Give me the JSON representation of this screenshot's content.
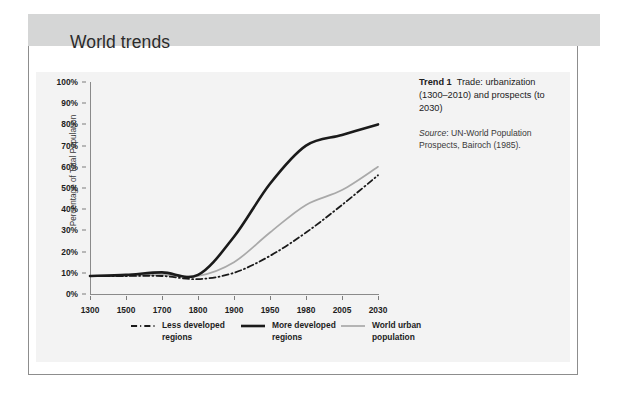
{
  "header": {
    "title": "World trends"
  },
  "caption": {
    "lead": "Trend 1",
    "body": "Trade: urbanization (1300–2010) and prospects (to 2030)",
    "source_label": "Source",
    "source_text": ": UN-World Population Prospects, Bairoch (1985)."
  },
  "chart_data": {
    "type": "line",
    "title": "",
    "xlabel": "",
    "ylabel": "Percentage of Total Population",
    "categories": [
      "1300",
      "1500",
      "1700",
      "1800",
      "1900",
      "1950",
      "1980",
      "2005",
      "2030"
    ],
    "ylim": [
      0,
      100
    ],
    "ytick_labels": [
      "0%",
      "10%",
      "20%",
      "30%",
      "40%",
      "50%",
      "60%",
      "70%",
      "80%",
      "90%",
      "100%"
    ],
    "ytick_values": [
      0,
      10,
      20,
      30,
      40,
      50,
      60,
      70,
      80,
      90,
      100
    ],
    "grid": false,
    "legend_position": "bottom",
    "series": [
      {
        "name": "Less developed regions",
        "style": "dash-dot",
        "color": "#1a1a1a",
        "width": 1.8,
        "values": [
          8.5,
          8.5,
          8.5,
          7.0,
          10.0,
          18.0,
          29.0,
          42.0,
          56.0
        ]
      },
      {
        "name": "More developed regions",
        "style": "solid",
        "color": "#1a1a1a",
        "width": 2.6,
        "values": [
          8.5,
          9.0,
          10.2,
          9.0,
          27.0,
          52.0,
          70.0,
          75.0,
          80.0
        ]
      },
      {
        "name": "World urban population",
        "style": "solid",
        "color": "#a9a9a9",
        "width": 1.7,
        "values": [
          8.5,
          8.5,
          9.0,
          8.5,
          15.0,
          29.0,
          42.0,
          49.0,
          60.0
        ]
      }
    ]
  }
}
